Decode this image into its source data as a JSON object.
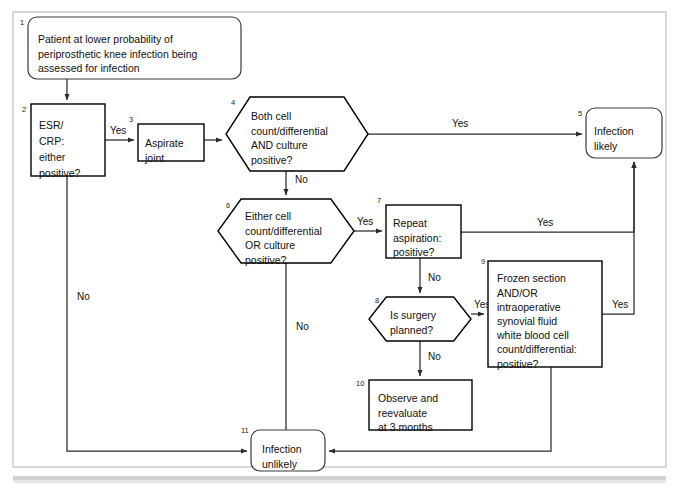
{
  "figure": {
    "kind": "flowchart",
    "canvas": {
      "width": 679,
      "height": 492
    },
    "frame": {
      "x": 13,
      "y": 12,
      "width": 653,
      "height": 455,
      "color": "#b9b9b9"
    },
    "colors": {
      "line": "#2b2b2b",
      "node_stroke": "#000000",
      "rounded_stroke": "#3a3a3a",
      "node_fill": "#ffffff",
      "background": "#ffffff",
      "footer_band": "#d2d2d2"
    }
  },
  "nodes": [
    {
      "id": "n1",
      "number": "1",
      "shape": "rounded-rect",
      "lines": [
        "Patient at lower probability of",
        "periprosthetic knee infection being",
        "assessed for infection"
      ],
      "x": 28,
      "y": 17,
      "w": 213,
      "h": 62,
      "num_x": 20,
      "num_y": 25,
      "text_x": 38,
      "text_y": 34,
      "line_height": 14.5,
      "align": "start"
    },
    {
      "id": "n2",
      "number": "2",
      "shape": "rect",
      "lines": [
        "ESR/",
        "CRP:",
        "either",
        "positive?"
      ],
      "x": 31,
      "y": 104,
      "w": 74,
      "h": 72,
      "num_x": 22,
      "num_y": 112,
      "text_x": 39,
      "text_y": 120,
      "line_height": 16,
      "align": "start"
    },
    {
      "id": "n3",
      "number": "3",
      "shape": "rect",
      "lines": [
        "Aspirate",
        "joint"
      ],
      "x": 138,
      "y": 124,
      "w": 66,
      "h": 37,
      "num_x": 129,
      "num_y": 122,
      "text_x": 145,
      "text_y": 138,
      "line_height": 14.5,
      "align": "start"
    },
    {
      "id": "n4",
      "number": "4",
      "shape": "hexagon",
      "lines": [
        "Both cell",
        "count/differential",
        "AND culture",
        "positive?"
      ],
      "x": 226,
      "y": 97,
      "w": 142,
      "h": 74,
      "num_x": 231,
      "num_y": 105,
      "text_x": 251,
      "text_y": 111,
      "line_height": 14.5,
      "align": "start"
    },
    {
      "id": "n5",
      "number": "5",
      "shape": "rounded-rect",
      "lines": [
        "Infection",
        "likely"
      ],
      "x": 586,
      "y": 108,
      "w": 76,
      "h": 50,
      "num_x": 578,
      "num_y": 116,
      "text_x": 594,
      "text_y": 126,
      "line_height": 14.5,
      "align": "start"
    },
    {
      "id": "n6",
      "number": "6",
      "shape": "hexagon",
      "lines": [
        "Either cell",
        "count/differential",
        "OR culture",
        "positive?"
      ],
      "x": 218,
      "y": 199,
      "w": 136,
      "h": 64,
      "num_x": 226,
      "num_y": 208,
      "text_x": 245,
      "text_y": 211,
      "line_height": 14.5,
      "align": "start"
    },
    {
      "id": "n7",
      "number": "7",
      "shape": "rect",
      "lines": [
        "Repeat",
        "aspiration:",
        "positive?"
      ],
      "x": 386,
      "y": 205,
      "w": 75,
      "h": 53,
      "num_x": 377,
      "num_y": 203,
      "text_x": 393,
      "text_y": 218,
      "line_height": 14.5,
      "align": "start"
    },
    {
      "id": "n8",
      "number": "8",
      "shape": "hexagon",
      "lines": [
        "Is surgery",
        "planned?"
      ],
      "x": 369,
      "y": 297,
      "w": 102,
      "h": 44,
      "num_x": 375,
      "num_y": 303,
      "text_x": 390,
      "text_y": 310,
      "line_height": 14.5,
      "align": "start"
    },
    {
      "id": "n9",
      "number": "9",
      "shape": "rect",
      "lines": [
        "Frozen section",
        "AND/OR",
        "intraoperative",
        "synovial fluid",
        "white blood cell",
        "count/differential:",
        "positive?"
      ],
      "x": 488,
      "y": 261,
      "w": 114,
      "h": 106,
      "num_x": 481,
      "num_y": 264,
      "text_x": 497,
      "text_y": 273,
      "line_height": 14.2,
      "align": "start"
    },
    {
      "id": "n10",
      "number": "10",
      "shape": "rect",
      "lines": [
        "Observe and",
        "reevaluate",
        "at 3 months"
      ],
      "x": 369,
      "y": 380,
      "w": 103,
      "h": 50,
      "num_x": 356,
      "num_y": 386,
      "text_x": 378,
      "text_y": 393,
      "line_height": 14.5,
      "align": "start"
    },
    {
      "id": "n11",
      "number": "11",
      "shape": "rounded-rect",
      "lines": [
        "Infection",
        "unlikely"
      ],
      "x": 251,
      "y": 430,
      "w": 74,
      "h": 41,
      "num_x": 241,
      "num_y": 433,
      "text_x": 262,
      "text_y": 444,
      "line_height": 14.5,
      "align": "start"
    }
  ],
  "edges": [
    {
      "id": "e1",
      "from": "n1",
      "to": "n2",
      "label": "",
      "path": "M 67,79 L 67,100",
      "arrow": true
    },
    {
      "id": "e2",
      "from": "n2",
      "to": "n3",
      "label": "Yes",
      "label_x": 110,
      "label_y": 134,
      "path": "M 105,140 L 134,140",
      "arrow": true
    },
    {
      "id": "e3",
      "from": "n3",
      "to": "n4",
      "label": "",
      "path": "M 204,140 L 222,140",
      "arrow": true
    },
    {
      "id": "e4",
      "from": "n4",
      "to": "n5",
      "label": "Yes",
      "label_x": 452,
      "label_y": 127,
      "path": "M 368,134 L 582,134",
      "arrow": true
    },
    {
      "id": "e5",
      "from": "n4",
      "to": "n6",
      "label": "No",
      "label_x": 295,
      "label_y": 183,
      "path": "M 286,171 L 286,195",
      "arrow": true
    },
    {
      "id": "e6",
      "from": "n6",
      "to": "n7",
      "label": "Yes",
      "label_x": 357,
      "label_y": 225,
      "path": "M 354,231 L 382,231",
      "arrow": true
    },
    {
      "id": "e7",
      "from": "n6",
      "to": "n11",
      "label": "No",
      "label_x": 296,
      "label_y": 330,
      "path": "M 286,263 L 286,447",
      "arrow": true
    },
    {
      "id": "e8",
      "from": "n7",
      "to": "n5",
      "label": "Yes",
      "label_x": 537,
      "label_y": 226,
      "path": "M 461,232 L 634,232 L 634,162",
      "arrow": true
    },
    {
      "id": "e9",
      "from": "n7",
      "to": "n8",
      "label": "No",
      "label_x": 428,
      "label_y": 281,
      "path": "M 420,258 L 420,293",
      "arrow": true
    },
    {
      "id": "e10",
      "from": "n8",
      "to": "n9",
      "label": "Yes",
      "label_x": 474,
      "label_y": 308,
      "path": "M 471,314 L 484,314",
      "arrow": true
    },
    {
      "id": "e11",
      "from": "n8",
      "to": "n10",
      "label": "No",
      "label_x": 428,
      "label_y": 360,
      "path": "M 420,341 L 420,376",
      "arrow": true
    },
    {
      "id": "e12",
      "from": "n9",
      "to": "n5",
      "label": "Yes",
      "label_x": 612,
      "label_y": 308,
      "path": "M 602,314 L 634,314 L 634,162",
      "arrow": true
    },
    {
      "id": "e13",
      "from": "n9",
      "to": "n11",
      "label": "No",
      "label_x": 560,
      "label_y": 334,
      "path": "M 551,367 L 551,451 L 329,451",
      "arrow": true
    },
    {
      "id": "e14",
      "from": "n2",
      "to": "n11",
      "label": "No",
      "label_x": 77,
      "label_y": 300,
      "path": "M 67,176 L 67,451 L 247,451",
      "arrow": true
    }
  ]
}
